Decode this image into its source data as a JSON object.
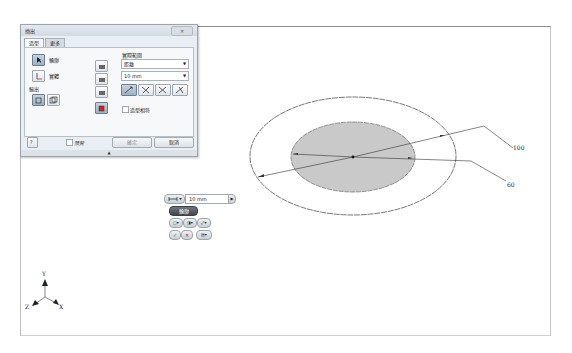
{
  "dialog": {
    "title": "擠出",
    "tabs": [
      {
        "label": "造型"
      },
      {
        "label": "更多"
      }
    ],
    "shape": {
      "profile_label": "輪廓",
      "solid_label": "實體",
      "output_label": "輸出"
    },
    "extents": {
      "title": "實際範圍",
      "type_value": "距離",
      "distance_value": "10 mm",
      "match_shape_label": "造型相符"
    },
    "footer": {
      "help_icon": "?",
      "preview_label": "預覽",
      "ok_label": "確定",
      "cancel_label": "取消"
    },
    "close_label": "✕",
    "grip_glyph": "▲"
  },
  "mini_toolbar": {
    "distance_value": "10 mm",
    "profile_label": "輪廓",
    "ok_glyph": "✓",
    "cancel_glyph": "✕"
  },
  "drawing": {
    "dimensions": [
      {
        "label": "100"
      },
      {
        "label": "60"
      }
    ],
    "outer_ellipse": {
      "cx": 332,
      "cy": 130,
      "rx": 103,
      "ry": 59
    },
    "inner_ellipse": {
      "cx": 332,
      "cy": 130,
      "rx": 62,
      "ry": 35,
      "fill": "#c8c8c8"
    }
  },
  "triad": {
    "x": "X",
    "y": "Y",
    "z": "Z"
  }
}
